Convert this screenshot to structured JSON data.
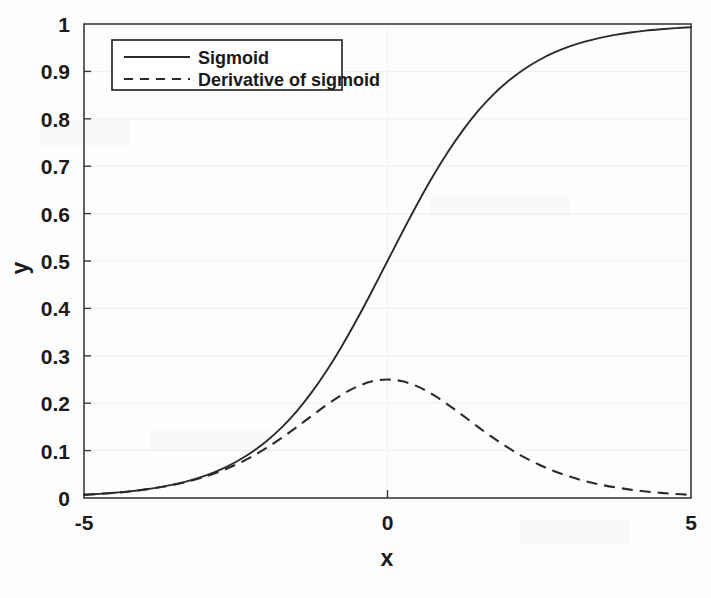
{
  "figure": {
    "background_color": "#fdfdfd",
    "ink_color": "#2b2b2b",
    "grid_color": "#efefef"
  },
  "axis": {
    "x_title": "x",
    "y_title": "y",
    "x_ticks": [
      "-5",
      "0",
      "5"
    ],
    "x_tick_values": [
      -5,
      0,
      5
    ],
    "y_ticks": [
      "0",
      "0.1",
      "0.2",
      "0.3",
      "0.4",
      "0.5",
      "0.6",
      "0.7",
      "0.8",
      "0.9",
      "1"
    ],
    "y_tick_values": [
      0,
      0.1,
      0.2,
      0.3,
      0.4,
      0.5,
      0.6,
      0.7,
      0.8,
      0.9,
      1
    ]
  },
  "legend": {
    "position": "upper-left",
    "entries": [
      {
        "label": "Sigmoid",
        "style": "solid"
      },
      {
        "label": "Derivative of sigmoid",
        "style": "dashed"
      }
    ]
  },
  "chart_data": {
    "type": "line",
    "title": "",
    "xlabel": "x",
    "ylabel": "y",
    "xlim": [
      -5,
      5
    ],
    "ylim": [
      0,
      1
    ],
    "grid": true,
    "legend_position": "upper-left",
    "x": [
      -5,
      -4.75,
      -4.5,
      -4.25,
      -4,
      -3.75,
      -3.5,
      -3.25,
      -3,
      -2.75,
      -2.5,
      -2.25,
      -2,
      -1.75,
      -1.5,
      -1.25,
      -1,
      -0.75,
      -0.5,
      -0.25,
      0,
      0.25,
      0.5,
      0.75,
      1,
      1.25,
      1.5,
      1.75,
      2,
      2.25,
      2.5,
      2.75,
      3,
      3.25,
      3.5,
      3.75,
      4,
      4.25,
      4.5,
      4.75,
      5
    ],
    "series": [
      {
        "name": "Sigmoid",
        "style": "solid",
        "color": "#2b2b2b",
        "values": [
          0.0067,
          0.0086,
          0.011,
          0.014,
          0.018,
          0.023,
          0.0293,
          0.0373,
          0.0474,
          0.0601,
          0.0759,
          0.0953,
          0.1192,
          0.148,
          0.1824,
          0.2227,
          0.2689,
          0.3208,
          0.3775,
          0.4378,
          0.5,
          0.5622,
          0.6225,
          0.6792,
          0.7311,
          0.7773,
          0.8176,
          0.852,
          0.8808,
          0.9047,
          0.9241,
          0.9399,
          0.9526,
          0.9627,
          0.9707,
          0.977,
          0.982,
          0.986,
          0.989,
          0.9914,
          0.9933
        ]
      },
      {
        "name": "Derivative of sigmoid",
        "style": "dashed",
        "color": "#2b2b2b",
        "values": [
          0.0066,
          0.0085,
          0.0109,
          0.0138,
          0.0177,
          0.0225,
          0.0284,
          0.0359,
          0.0452,
          0.0565,
          0.0701,
          0.0862,
          0.105,
          0.1261,
          0.1491,
          0.1731,
          0.1966,
          0.2179,
          0.235,
          0.2461,
          0.25,
          0.2461,
          0.235,
          0.2179,
          0.1966,
          0.1731,
          0.1491,
          0.1261,
          0.105,
          0.0862,
          0.0701,
          0.0565,
          0.0452,
          0.0359,
          0.0284,
          0.0225,
          0.0177,
          0.0138,
          0.0109,
          0.0085,
          0.0066
        ]
      }
    ]
  }
}
